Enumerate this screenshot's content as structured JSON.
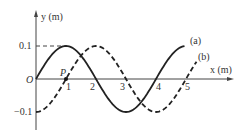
{
  "chart_data": {
    "type": "line",
    "title": "",
    "xlabel": "x (m)",
    "ylabel": "y (m)",
    "origin_label": "O",
    "point_label": "P",
    "point": {
      "x": 1,
      "y": 0
    },
    "xticks": [
      "1",
      "2",
      "3",
      "4",
      "5"
    ],
    "yticks": [
      "0.1",
      "-0.1"
    ],
    "xlim": [
      0,
      5.6
    ],
    "ylim": [
      -0.14,
      0.2
    ],
    "grid": false,
    "series": [
      {
        "name": "(a)",
        "style": "solid",
        "function": "0.1*sin(pi*x/2)",
        "x_range": [
          0,
          4.95
        ],
        "x": [
          0,
          1,
          2,
          3,
          4,
          4.95
        ],
        "y": [
          0,
          0.1,
          0,
          -0.1,
          0,
          0.1
        ]
      },
      {
        "name": "(b)",
        "style": "dashed",
        "function": "-0.1*cos(pi*x/2)",
        "x_range": [
          0,
          5.35
        ],
        "x": [
          0,
          1,
          2,
          3,
          4,
          5,
          5.35
        ],
        "y": [
          -0.1,
          0,
          0.1,
          0,
          -0.1,
          0,
          0.05
        ]
      }
    ]
  },
  "labels": {
    "y_axis": "y (m)",
    "x_axis": "x (m)",
    "origin": "O",
    "point": "P",
    "tick_pos": "0.1",
    "tick_neg": "−0.1",
    "x1": "1",
    "x2": "2",
    "x3": "3",
    "x4": "4",
    "x5": "5",
    "curve_a": "(a)",
    "curve_b": "(b)"
  }
}
